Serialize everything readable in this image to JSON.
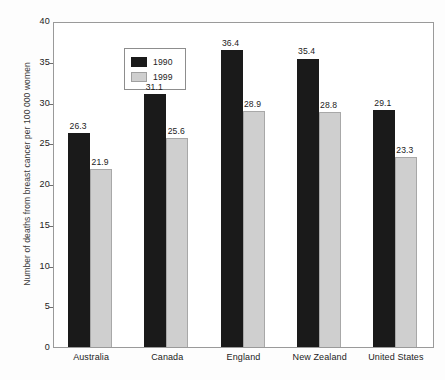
{
  "chart_data": {
    "type": "bar",
    "title": "",
    "xlabel": "",
    "ylabel": "Number of deaths from breast cancer per 100 000 women",
    "ylim": [
      0,
      40
    ],
    "yticks": [
      0,
      5,
      10,
      15,
      20,
      25,
      30,
      35,
      40
    ],
    "ytick_labels": [
      "0",
      "5",
      "10",
      "15",
      "20",
      "25",
      "30",
      "35",
      "40"
    ],
    "grid": false,
    "legend_position": "upper-left-inside",
    "categories": [
      "Australia",
      "Canada",
      "England",
      "New Zealand",
      "United States"
    ],
    "series": [
      {
        "name": "1990",
        "color": "#1a1a1a",
        "values": [
          26.3,
          31.1,
          36.4,
          35.4,
          29.1
        ],
        "labels": [
          "26.3",
          "31.1",
          "36.4",
          "35.4",
          "29.1"
        ]
      },
      {
        "name": "1999",
        "color": "#cfcfcf",
        "values": [
          21.9,
          25.6,
          28.9,
          28.8,
          23.3
        ],
        "labels": [
          "21.9",
          "25.6",
          "28.9",
          "28.8",
          "23.3"
        ]
      }
    ]
  },
  "legend": {
    "entries": [
      {
        "label": "1990",
        "swatch": "dark-swatch"
      },
      {
        "label": "1999",
        "swatch": "light-swatch"
      }
    ]
  },
  "colors": {
    "series_1990": "#1a1a1a",
    "series_1999": "#cfcfcf",
    "frame": "#9a9a9a",
    "background": "#ffffff",
    "text": "#1c1c1c"
  }
}
